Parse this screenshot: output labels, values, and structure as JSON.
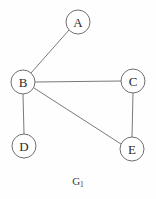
{
  "figure": {
    "caption_main": "G",
    "caption_subscript": "1",
    "caption_full": "G1",
    "background_color": "#fefefe",
    "width": 156,
    "height": 199
  },
  "graph": {
    "stroke_color": "#7a7a7a",
    "node_stroke_color": "#6f6f6f",
    "node_fill_color": "#ffffff",
    "label_color": "#2a2a2a",
    "node_radius": 12,
    "nodes": [
      {
        "id": "A",
        "label": "A",
        "cx": 78,
        "cy": 22
      },
      {
        "id": "B",
        "label": "B",
        "cx": 23,
        "cy": 82
      },
      {
        "id": "C",
        "label": "C",
        "cx": 133,
        "cy": 81
      },
      {
        "id": "D",
        "label": "D",
        "cx": 24,
        "cy": 146
      },
      {
        "id": "E",
        "label": "E",
        "cx": 132,
        "cy": 149
      }
    ],
    "edges": [
      {
        "id": "A-B",
        "from": "A",
        "to": "B",
        "x1": 69,
        "y1": 30,
        "x2": 31,
        "y2": 73
      },
      {
        "id": "B-C",
        "from": "B",
        "to": "C",
        "x1": 35,
        "y1": 82,
        "x2": 121,
        "y2": 81
      },
      {
        "id": "B-D",
        "from": "B",
        "to": "D",
        "x1": 23,
        "y1": 94,
        "x2": 24,
        "y2": 134
      },
      {
        "id": "B-E",
        "from": "B",
        "to": "E",
        "x1": 34,
        "y1": 88,
        "x2": 121,
        "y2": 144
      },
      {
        "id": "C-E",
        "from": "C",
        "to": "E",
        "x1": 133,
        "y1": 93,
        "x2": 132,
        "y2": 137
      }
    ]
  }
}
